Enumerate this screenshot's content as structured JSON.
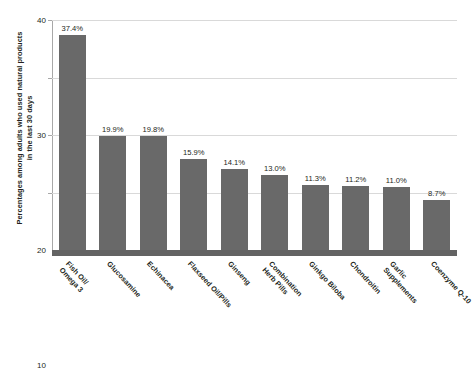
{
  "chart_data": {
    "type": "bar",
    "title": "",
    "xlabel": "",
    "ylabel": "Percentages among adults who used natural products in the last 30 days",
    "ylabel_lines": [
      "Percentages among adults who used natural products",
      "in the last 30 days"
    ],
    "ylim": [
      0,
      40
    ],
    "yticks": [
      10,
      20,
      30,
      40
    ],
    "ytick_labels": [
      "10",
      "20",
      "30",
      "40"
    ],
    "grid": true,
    "legend": "none",
    "bar_color": "#696969",
    "gridline_color": "#d9d9d9",
    "axis_color": "#a8a8a8",
    "baseline_color": "#636363",
    "categories": [
      "Fish Oil/ Omega 3",
      "Glucosamine",
      "Echinacea",
      "Flaxseed Oil/Pills",
      "Ginseng",
      "Combination Herb Pills",
      "Ginkgo Biloba",
      "Chondroitin",
      "Garlic Supplements",
      "Coenzyme Q-10"
    ],
    "category_lines": [
      [
        "Fish Oil/",
        "Omega 3"
      ],
      [
        "Glucosamine"
      ],
      [
        "Echinacea"
      ],
      [
        "Flaxseed Oil/Pills"
      ],
      [
        "Ginseng"
      ],
      [
        "Combination",
        "Herb Pills"
      ],
      [
        "Ginkgo Biloba"
      ],
      [
        "Chondroitin"
      ],
      [
        "Garlic",
        "Supplements"
      ],
      [
        "Coenzyme Q-10"
      ]
    ],
    "values": [
      37.4,
      19.9,
      19.8,
      15.9,
      14.1,
      13.0,
      11.3,
      11.2,
      11.0,
      8.7
    ],
    "value_labels": [
      "37.4%",
      "19.9%",
      "19.8%",
      "15.9%",
      "14.1%",
      "13.0%",
      "11.3%",
      "11.2%",
      "11.0%",
      "8.7%"
    ]
  }
}
